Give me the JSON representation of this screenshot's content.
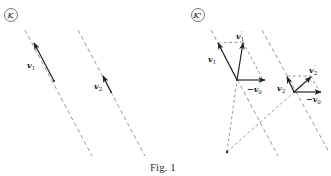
{
  "figure": {
    "caption": "Fig. 1",
    "panels": [
      {
        "id": "left",
        "frame_label": "K",
        "vectors": [
          {
            "name": "v",
            "subscript": "1",
            "prime": ""
          },
          {
            "name": "v",
            "subscript": "2",
            "prime": ""
          }
        ]
      },
      {
        "id": "right",
        "frame_label": "K'",
        "vectors": [
          {
            "name": "v",
            "subscript": "1",
            "prime": ""
          },
          {
            "name": "v",
            "subscript": "1",
            "prime": "′"
          },
          {
            "name": "−v",
            "subscript": "0",
            "prime": ""
          },
          {
            "name": "v",
            "subscript": "2",
            "prime": ""
          },
          {
            "name": "v",
            "subscript": "2",
            "prime": "′"
          },
          {
            "name": "−v",
            "subscript": "0",
            "prime": ""
          }
        ]
      }
    ]
  },
  "colors": {
    "ink": "#222222",
    "dashed": "#6a6a6a",
    "background": "#ffffff"
  }
}
